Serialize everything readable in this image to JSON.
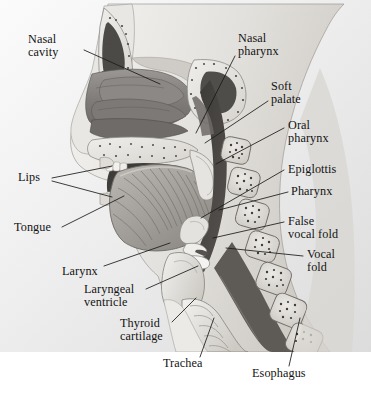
{
  "figure": {
    "background_color": "#ffffff",
    "plate_color": "#e8e8e8",
    "ink_color": "#131313",
    "leader_color": "#1a1a1a"
  },
  "labels": [
    {
      "id": "nasal-cavity",
      "text": "Nasal\ncavity",
      "x": 28,
      "y": 38,
      "align": "left"
    },
    {
      "id": "lips",
      "text": "Lips",
      "x": 18,
      "y": 175,
      "align": "left"
    },
    {
      "id": "tongue",
      "text": "Tongue",
      "x": 14,
      "y": 224,
      "align": "left"
    },
    {
      "id": "larynx",
      "text": "Larynx",
      "x": 62,
      "y": 269,
      "align": "left"
    },
    {
      "id": "laryngeal-ventricle",
      "text": "Laryngeal\nventricle",
      "x": 84,
      "y": 287,
      "align": "left"
    },
    {
      "id": "thyroid-cartilage",
      "text": "Thyroid\ncartilage",
      "x": 120,
      "y": 320,
      "align": "left"
    },
    {
      "id": "trachea",
      "text": "Trachea",
      "x": 163,
      "y": 361,
      "align": "left"
    },
    {
      "id": "nasal-pharynx",
      "text": "Nasal\npharynx",
      "x": 238,
      "y": 36,
      "align": "left"
    },
    {
      "id": "soft-palate",
      "text": "Soft\npalate",
      "x": 271,
      "y": 84,
      "align": "left"
    },
    {
      "id": "oral-pharynx",
      "text": "Oral\npharynx",
      "x": 288,
      "y": 123,
      "align": "left"
    },
    {
      "id": "epiglottis",
      "text": "Epiglottis",
      "x": 288,
      "y": 167,
      "align": "left"
    },
    {
      "id": "pharynx",
      "text": "Pharynx",
      "x": 291,
      "y": 189,
      "align": "left"
    },
    {
      "id": "false-vocal-fold",
      "text": "False\nvocal fold",
      "x": 288,
      "y": 219,
      "align": "left"
    },
    {
      "id": "vocal-fold",
      "text": "Vocal\nfold",
      "x": 307,
      "y": 252,
      "align": "left"
    },
    {
      "id": "esophagus",
      "text": "Esophagus",
      "x": 252,
      "y": 371,
      "align": "left"
    }
  ],
  "leaders": [
    {
      "id": "leader-nasal-cavity",
      "points": "84,50 160,84"
    },
    {
      "id": "leader-lips-upper",
      "points": "52,178 112,166"
    },
    {
      "id": "leader-lips-lower",
      "points": "52,181 112,197"
    },
    {
      "id": "leader-tongue",
      "points": "62,227 124,196"
    },
    {
      "id": "leader-larynx",
      "points": "104,266 170,243"
    },
    {
      "id": "leader-laryngeal-vent",
      "points": "146,289 196,268"
    },
    {
      "id": "leader-thyroid",
      "points": "172,322 196,300"
    },
    {
      "id": "leader-trachea",
      "points": "200,358 214,320"
    },
    {
      "id": "leader-nasal-pharynx",
      "points": "235,54 196,133"
    },
    {
      "id": "leader-soft-palate",
      "points": "268,101 205,143"
    },
    {
      "id": "leader-oral-pharynx",
      "points": "283,127 216,164"
    },
    {
      "id": "leader-epiglottis",
      "points": "284,170 201,218"
    },
    {
      "id": "leader-pharynx",
      "points": "287,192 219,210"
    },
    {
      "id": "leader-false-fold",
      "points": "284,222 213,238"
    },
    {
      "id": "leader-vocal-fold",
      "points": "303,255 226,248"
    },
    {
      "id": "leader-esophagus",
      "points": "290,366 300,320"
    }
  ]
}
